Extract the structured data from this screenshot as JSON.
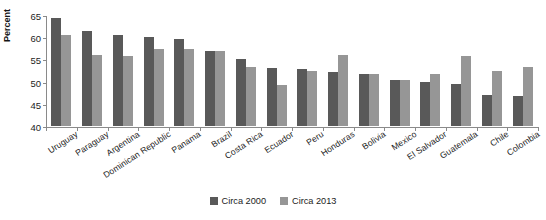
{
  "chart_data": {
    "type": "bar",
    "title": "",
    "xlabel": "",
    "ylabel": "Percent",
    "ylim": [
      40,
      65
    ],
    "yticks": [
      40,
      45,
      50,
      55,
      60,
      65
    ],
    "grid": false,
    "legend_position": "bottom",
    "categories": [
      "Uruguay",
      "Paraguay",
      "Argentina",
      "Dominican Republic",
      "Panama",
      "Brazil",
      "Costa Rica",
      "Ecuador",
      "Peru",
      "Honduras",
      "Bolivia",
      "Mexico",
      "El Salvador",
      "Guatemala",
      "Chile",
      "Colombia"
    ],
    "series": [
      {
        "name": "Circa 2000",
        "color": "#595959",
        "values": [
          64.4,
          61.5,
          60.4,
          60.1,
          59.7,
          56.8,
          55.0,
          53.0,
          52.9,
          52.2,
          51.8,
          50.3,
          49.9,
          49.4,
          47.0,
          46.7
        ]
      },
      {
        "name": "Circa 2013",
        "color": "#969696",
        "values": [
          60.4,
          56.0,
          55.8,
          57.4,
          57.4,
          57.0,
          53.4,
          49.3,
          52.5,
          55.9,
          51.8,
          50.4,
          51.8,
          55.8,
          52.3,
          53.3
        ]
      }
    ]
  },
  "legend": {
    "items": [
      {
        "label": "Circa 2000",
        "color": "#595959"
      },
      {
        "label": "Circa 2013",
        "color": "#969696"
      }
    ]
  },
  "axes": {
    "y_title": "Percent"
  }
}
